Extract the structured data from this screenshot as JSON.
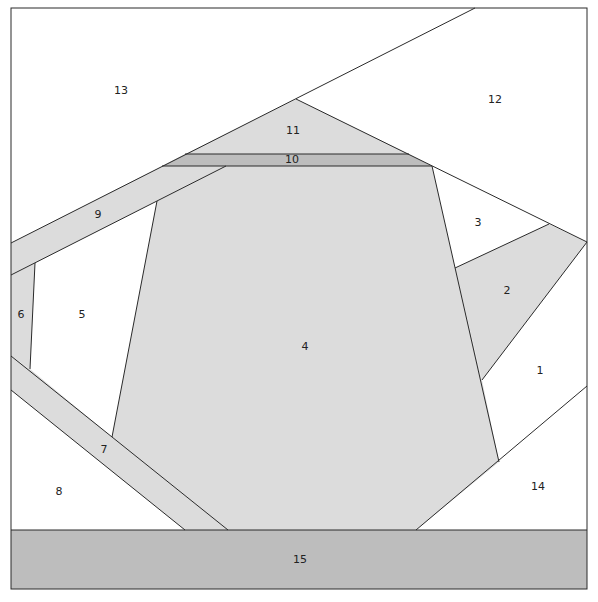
{
  "colors": {
    "white": "#ffffff",
    "light_gray": "#dcdcdc",
    "mid_gray": "#bdbdbd",
    "line": "#2a2a2a"
  },
  "pieces": [
    {
      "id": "1",
      "label": "1",
      "fill": "white",
      "lx": 540,
      "ly": 371
    },
    {
      "id": "2",
      "label": "2",
      "fill": "light_gray",
      "lx": 507,
      "ly": 291
    },
    {
      "id": "3",
      "label": "3",
      "fill": "white",
      "lx": 478,
      "ly": 223
    },
    {
      "id": "4",
      "label": "4",
      "fill": "light_gray",
      "lx": 305,
      "ly": 347
    },
    {
      "id": "5",
      "label": "5",
      "fill": "white",
      "lx": 82,
      "ly": 315
    },
    {
      "id": "6",
      "label": "6",
      "fill": "light_gray",
      "lx": 21,
      "ly": 315
    },
    {
      "id": "7",
      "label": "7",
      "fill": "light_gray",
      "lx": 104,
      "ly": 450
    },
    {
      "id": "8",
      "label": "8",
      "fill": "white",
      "lx": 59,
      "ly": 492
    },
    {
      "id": "9",
      "label": "9",
      "fill": "light_gray",
      "lx": 98,
      "ly": 215
    },
    {
      "id": "10",
      "label": "10",
      "fill": "mid_gray",
      "lx": 292,
      "ly": 160
    },
    {
      "id": "11",
      "label": "11",
      "fill": "light_gray",
      "lx": 293,
      "ly": 131
    },
    {
      "id": "12",
      "label": "12",
      "fill": "white",
      "lx": 495,
      "ly": 100
    },
    {
      "id": "13",
      "label": "13",
      "fill": "white",
      "lx": 121,
      "ly": 91
    },
    {
      "id": "14",
      "label": "14",
      "fill": "white",
      "lx": 538,
      "ly": 487
    },
    {
      "id": "15",
      "label": "15",
      "fill": "mid_gray",
      "lx": 300,
      "ly": 560
    }
  ]
}
